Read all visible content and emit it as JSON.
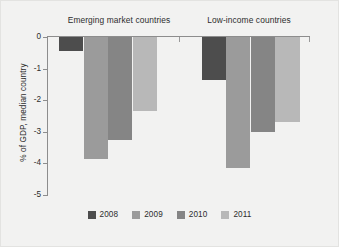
{
  "chart_data": {
    "type": "bar",
    "title": "",
    "subtitle": "",
    "xlabel": "",
    "ylabel": "% of GDP, median country",
    "ylim": [
      -5,
      0
    ],
    "yticks": [
      "0",
      "-1",
      "-2",
      "-3",
      "-4",
      "-5"
    ],
    "ytick_values": [
      0,
      -1,
      -2,
      -3,
      -4,
      -5
    ],
    "grid": false,
    "legend_position": "bottom",
    "categories": [
      "Emerging market countries",
      "Low-income countries"
    ],
    "series": [
      {
        "name": "2008",
        "color": "#4d4d4d",
        "values": [
          -0.45,
          -1.35
        ]
      },
      {
        "name": "2009",
        "color": "#9b9b9b",
        "values": [
          -3.85,
          -4.15
        ]
      },
      {
        "name": "2010",
        "color": "#858585",
        "values": [
          -3.25,
          -3.0
        ]
      },
      {
        "name": "2011",
        "color": "#b8b8b8",
        "values": [
          -2.35,
          -2.7
        ]
      }
    ]
  },
  "legend": {
    "items": [
      {
        "label": "2008",
        "color": "#4d4d4d"
      },
      {
        "label": "2009",
        "color": "#9b9b9b"
      },
      {
        "label": "2010",
        "color": "#858585"
      },
      {
        "label": "2011",
        "color": "#b8b8b8"
      }
    ]
  },
  "colors": {
    "background": "#f2f2f1",
    "axis": "#8d8d8d",
    "text": "#2d2d2d"
  }
}
